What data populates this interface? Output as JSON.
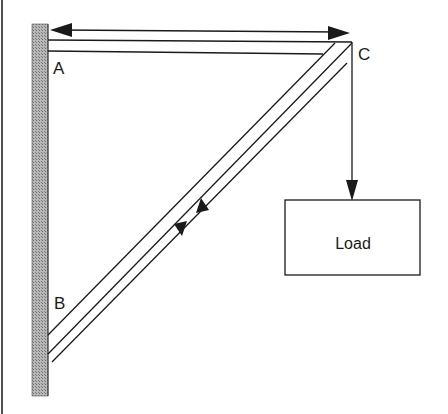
{
  "diagram": {
    "title": "",
    "labels": {
      "a": "A",
      "b": "B",
      "c": "C",
      "load": "Load"
    },
    "colors": {
      "line": "#1a1a1a",
      "wall_fill": "#9a9a9a",
      "background": "#ffffff"
    },
    "elements": [
      {
        "id": "wall",
        "type": "hatched-wall",
        "x": 32,
        "y": 24,
        "w": 16,
        "h": 372
      },
      {
        "id": "horizontal-beam",
        "from": "A",
        "to": "C"
      },
      {
        "id": "diagonal-strut",
        "from": "B",
        "to": "C"
      },
      {
        "id": "tension-arrow",
        "type": "double-headed",
        "between": [
          "A",
          "C"
        ]
      },
      {
        "id": "compression-arrows",
        "type": "opposing",
        "on": "diagonal-strut"
      },
      {
        "id": "load-arrow",
        "from": "C",
        "to": "Load"
      },
      {
        "id": "load-box",
        "label": "Load"
      }
    ]
  }
}
